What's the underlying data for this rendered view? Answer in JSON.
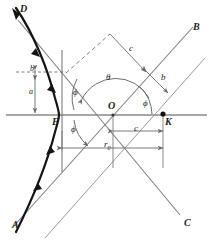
{
  "figure": {
    "type": "geometry-diagram",
    "background_color": "#ffffff",
    "ink_color": "#1c1c1c",
    "line_color": "#6b6b6b",
    "curve_color": "#111111",
    "width": 213,
    "height": 243
  },
  "asymptote_labels": {
    "upper_left": "D",
    "lower_left": "A",
    "upper_right": "B",
    "lower_right": "C"
  },
  "point_labels": {
    "center": "O",
    "vertex": "E",
    "focus": "K"
  },
  "angle_labels": {
    "theta": "θ",
    "phi_upper_left": "ϕ",
    "phi_lower_left": "ϕ",
    "phi_right": "ϕ"
  },
  "dimension_labels": {
    "impact_parameter_left": "b",
    "semi_minor_left": "a",
    "c_diagonal": "c",
    "b_diagonal": "b",
    "c_horizontal": "c",
    "r_zero": "r",
    "r_zero_subscript": "0"
  },
  "arrow_markers": {
    "trajectory_direction_count": 3,
    "description": "arrowheads along incoming and outgoing hyperbola branch"
  }
}
